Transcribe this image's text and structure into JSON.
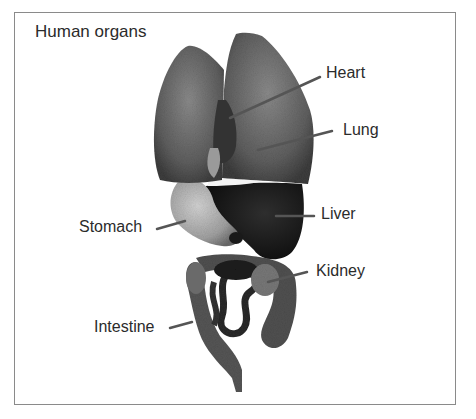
{
  "figure": {
    "title": "Human organs",
    "labels": [
      {
        "id": "heart",
        "text": "Heart"
      },
      {
        "id": "lung",
        "text": "Lung"
      },
      {
        "id": "stomach",
        "text": "Stomach"
      },
      {
        "id": "liver",
        "text": "Liver"
      },
      {
        "id": "kidney",
        "text": "Kidney"
      },
      {
        "id": "intestine",
        "text": "Intestine"
      }
    ],
    "colors": {
      "frame": "#8a8a8a",
      "lung": "#6e6e6e",
      "heart": "#3a3a3a",
      "liver": "#1e1e1e",
      "stomach": "#b4b4b4",
      "intestine": "#4a4a4a",
      "leader_line": "#555555"
    }
  }
}
